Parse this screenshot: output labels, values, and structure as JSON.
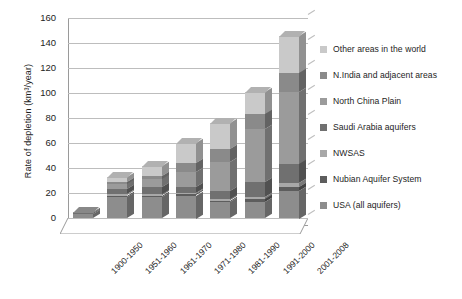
{
  "chart_data": {
    "type": "bar",
    "subtype": "stacked-bar-3d",
    "title": "",
    "xlabel": "",
    "ylabel": "Rate of depletion (km³/year)",
    "ylim": [
      0,
      160
    ],
    "yticks": [
      0,
      20,
      40,
      60,
      80,
      100,
      120,
      140,
      160
    ],
    "grid": "horizontal",
    "legend_position": "right",
    "categories": [
      "1900-1950",
      "1951-1960",
      "1961-1970",
      "1971-1980",
      "1981-1990",
      "1991-2000",
      "2001-2008"
    ],
    "series": [
      {
        "name": "USA (all aquifers)",
        "color": "#8d8d8d",
        "values": [
          3,
          17,
          17,
          18,
          13,
          13,
          22
        ]
      },
      {
        "name": "Nubian Aquifer System",
        "color": "#5d5d5d",
        "values": [
          0,
          1,
          1,
          1,
          1,
          2,
          3
        ]
      },
      {
        "name": "NWSAS",
        "color": "#a8a8a8",
        "values": [
          0,
          1,
          1,
          1,
          1,
          2,
          3
        ]
      },
      {
        "name": "Saudi Arabia aquifers",
        "color": "#707070",
        "values": [
          1,
          4,
          6,
          5,
          7,
          12,
          15
        ]
      },
      {
        "name": "North China Plain",
        "color": "#9b9b9b",
        "values": [
          1,
          4,
          6,
          12,
          23,
          42,
          58
        ]
      },
      {
        "name": "N.India and adjacent areas",
        "color": "#8a8a8a",
        "values": [
          0,
          2,
          3,
          7,
          10,
          12,
          15
        ]
      },
      {
        "name": "Other areas in the world",
        "color": "#c9c9c9",
        "values": [
          0,
          4,
          8,
          16,
          21,
          18,
          30
        ]
      }
    ],
    "totals": [
      5,
      33,
      42,
      60,
      76,
      101,
      146
    ]
  },
  "legend": {
    "items": [
      {
        "label": "Other areas in the world",
        "color": "#c9c9c9"
      },
      {
        "label": "N.India and adjacent areas",
        "color": "#8a8a8a"
      },
      {
        "label": "North China Plain",
        "color": "#9b9b9b"
      },
      {
        "label": "Saudi Arabia aquifers",
        "color": "#707070"
      },
      {
        "label": "NWSAS",
        "color": "#a8a8a8"
      },
      {
        "label": "Nubian Aquifer System",
        "color": "#5d5d5d"
      },
      {
        "label": "USA (all aquifers)",
        "color": "#8d8d8d"
      }
    ]
  }
}
